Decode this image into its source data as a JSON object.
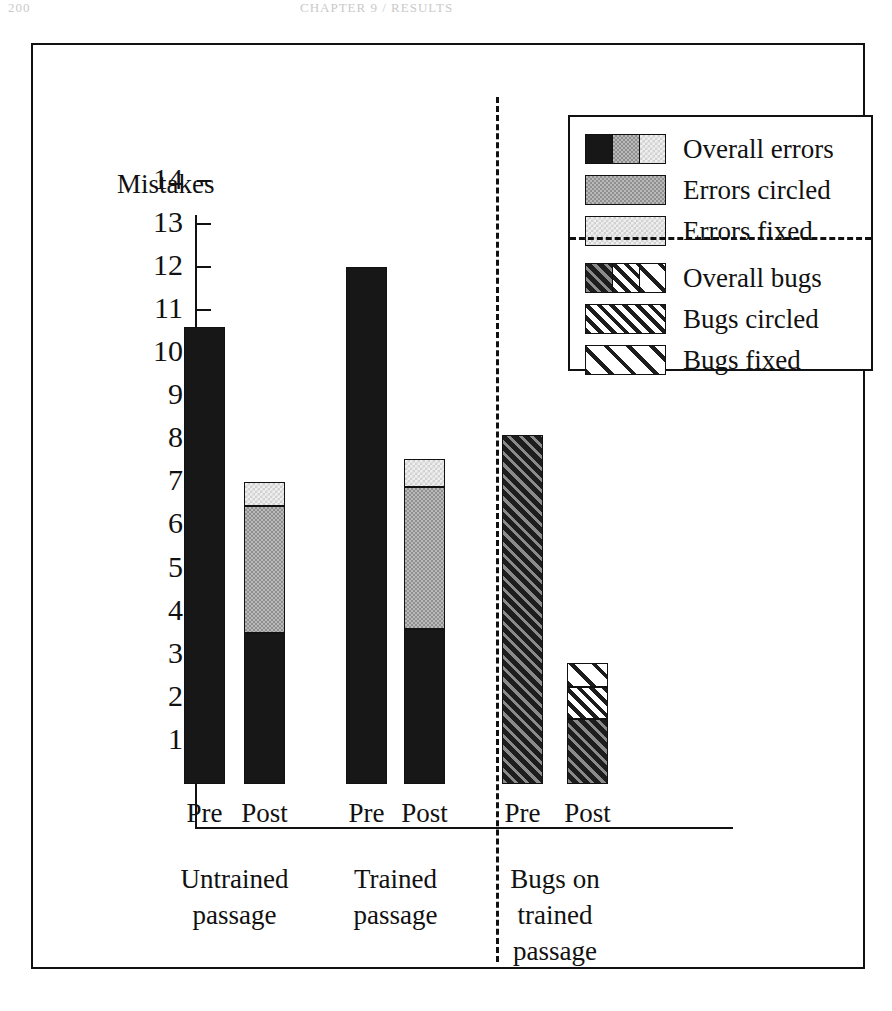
{
  "artifacts": {
    "left": "200",
    "center": "CHAPTER 9 / RESULTS"
  },
  "chart_data": {
    "type": "bar",
    "title": "",
    "subtitle": "",
    "xlabel": "",
    "ylabel": "Mistakes",
    "ylim": [
      0,
      14
    ],
    "grid": false,
    "stacked": true,
    "legend_position": "top-right",
    "y_ticks": [
      14,
      13,
      12,
      11,
      10,
      9,
      8,
      7,
      6,
      5,
      4,
      3,
      2,
      1
    ],
    "groups": [
      {
        "name": "Untrained passage",
        "label_lines": [
          "Untrained",
          "passage"
        ],
        "bars": [
          {
            "category": "Pre",
            "total": 10.6,
            "segments": [
              {
                "series": "Overall errors",
                "from": 0,
                "to": 10.6,
                "fill": "black"
              }
            ]
          },
          {
            "category": "Post",
            "total": 7.0,
            "segments": [
              {
                "series": "Overall errors",
                "from": 0,
                "to": 3.5,
                "fill": "black"
              },
              {
                "series": "Errors circled",
                "from": 3.5,
                "to": 6.45,
                "fill": "mid"
              },
              {
                "series": "Errors fixed",
                "from": 6.45,
                "to": 7.0,
                "fill": "light"
              }
            ]
          }
        ]
      },
      {
        "name": "Trained passage",
        "label_lines": [
          "Trained",
          "passage"
        ],
        "bars": [
          {
            "category": "Pre",
            "total": 12.0,
            "segments": [
              {
                "series": "Overall errors",
                "from": 0,
                "to": 12.0,
                "fill": "black"
              }
            ]
          },
          {
            "category": "Post",
            "total": 7.55,
            "segments": [
              {
                "series": "Overall errors",
                "from": 0,
                "to": 3.6,
                "fill": "black"
              },
              {
                "series": "Errors circled",
                "from": 3.6,
                "to": 6.9,
                "fill": "mid"
              },
              {
                "series": "Errors fixed",
                "from": 6.9,
                "to": 7.55,
                "fill": "light"
              }
            ]
          }
        ]
      },
      {
        "name": "Bugs on trained passage",
        "label_lines": [
          "Bugs on",
          "trained",
          "passage"
        ],
        "bars": [
          {
            "category": "Pre",
            "total": 8.1,
            "segments": [
              {
                "series": "Overall bugs",
                "from": 0,
                "to": 8.1,
                "fill": "hatch-dark"
              }
            ]
          },
          {
            "category": "Post",
            "total": 2.8,
            "segments": [
              {
                "series": "Overall bugs",
                "from": 0,
                "to": 1.5,
                "fill": "hatch-dark"
              },
              {
                "series": "Bugs circled",
                "from": 1.5,
                "to": 2.25,
                "fill": "hatch-mid"
              },
              {
                "series": "Bugs fixed",
                "from": 2.25,
                "to": 2.8,
                "fill": "hatch-light"
              }
            ]
          }
        ]
      }
    ],
    "series": [
      {
        "name": "Overall errors",
        "values": [
          10.6,
          3.5,
          12.0,
          3.6,
          null,
          null
        ]
      },
      {
        "name": "Errors circled",
        "values": [
          null,
          2.95,
          null,
          3.3,
          null,
          null
        ]
      },
      {
        "name": "Errors fixed",
        "values": [
          null,
          0.55,
          null,
          0.65,
          null,
          null
        ]
      },
      {
        "name": "Overall bugs",
        "values": [
          null,
          null,
          null,
          null,
          8.1,
          1.5
        ]
      },
      {
        "name": "Bugs circled",
        "values": [
          null,
          null,
          null,
          null,
          null,
          0.75
        ]
      },
      {
        "name": "Bugs fixed",
        "values": [
          null,
          null,
          null,
          null,
          null,
          0.55
        ]
      }
    ],
    "legend": [
      {
        "label": "Overall errors",
        "swatch": [
          "black",
          "mid",
          "light"
        ]
      },
      {
        "label": "Errors circled",
        "swatch": [
          "mid"
        ]
      },
      {
        "label": "Errors fixed",
        "swatch": [
          "light"
        ]
      },
      {
        "label": "Overall bugs",
        "swatch": [
          "hatch-dark",
          "hatch-mid",
          "hatch-light"
        ]
      },
      {
        "label": "Bugs circled",
        "swatch": [
          "hatch-mid"
        ]
      },
      {
        "label": "Bugs fixed",
        "swatch": [
          "hatch-light"
        ]
      }
    ]
  }
}
